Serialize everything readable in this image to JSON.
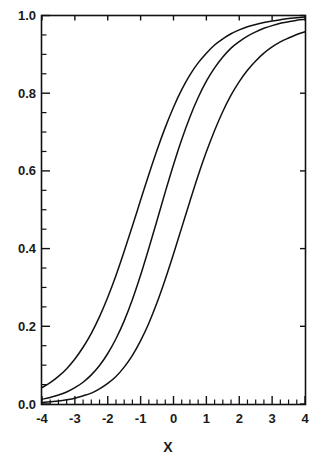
{
  "chart_data": {
    "type": "line",
    "title": "",
    "subtitle": "",
    "xlabel": "X",
    "ylabel": "",
    "xlim": [
      -4,
      4
    ],
    "ylim": [
      0.0,
      1.0
    ],
    "grid": false,
    "legend": "none",
    "x_ticks": [
      -4,
      -3,
      -2,
      -1,
      0,
      1,
      2,
      3,
      4
    ],
    "x_tick_labels": [
      "-4",
      "-3",
      "-2",
      "-1",
      "0",
      "1",
      "2",
      "3",
      "4"
    ],
    "x_minor_tick_step": 0.25,
    "y_ticks": [
      0.0,
      0.2,
      0.4,
      0.6,
      0.8,
      1.0
    ],
    "y_tick_labels": [
      "0.0",
      "0.2",
      "0.4",
      "0.6",
      "0.8",
      "1.0"
    ],
    "y_minor_tick_step": 0.05,
    "x": [
      -4,
      -3.75,
      -3.5,
      -3.25,
      -3,
      -2.75,
      -2.5,
      -2.25,
      -2,
      -1.75,
      -1.5,
      -1.25,
      -1,
      -0.75,
      -0.5,
      -0.25,
      0,
      0.25,
      0.5,
      0.75,
      1,
      1.25,
      1.5,
      1.75,
      2,
      2.25,
      2.5,
      2.75,
      3,
      3.25,
      3.5,
      3.75,
      4
    ],
    "series": [
      {
        "name": "curve-left",
        "values": [
          0.042,
          0.055,
          0.071,
          0.091,
          0.116,
          0.146,
          0.182,
          0.225,
          0.275,
          0.331,
          0.393,
          0.458,
          0.525,
          0.591,
          0.654,
          0.712,
          0.764,
          0.809,
          0.847,
          0.878,
          0.903,
          0.924,
          0.94,
          0.953,
          0.963,
          0.971,
          0.977,
          0.982,
          0.986,
          0.989,
          0.992,
          0.994,
          0.996
        ]
      },
      {
        "name": "curve-middle",
        "values": [
          0.012,
          0.017,
          0.023,
          0.031,
          0.042,
          0.056,
          0.075,
          0.099,
          0.13,
          0.168,
          0.214,
          0.269,
          0.332,
          0.401,
          0.473,
          0.546,
          0.616,
          0.681,
          0.739,
          0.789,
          0.831,
          0.865,
          0.893,
          0.916,
          0.933,
          0.947,
          0.958,
          0.967,
          0.974,
          0.98,
          0.984,
          0.988,
          0.99
        ]
      },
      {
        "name": "curve-right",
        "values": [
          0.004,
          0.006,
          0.008,
          0.011,
          0.015,
          0.021,
          0.028,
          0.039,
          0.053,
          0.071,
          0.095,
          0.125,
          0.163,
          0.208,
          0.261,
          0.321,
          0.386,
          0.454,
          0.522,
          0.588,
          0.649,
          0.704,
          0.753,
          0.795,
          0.83,
          0.859,
          0.883,
          0.903,
          0.919,
          0.932,
          0.942,
          0.951,
          0.958
        ]
      }
    ],
    "colors": {
      "curve": "#111111",
      "axis": "#111111",
      "background": "#ffffff",
      "text": "#1a1a1a"
    }
  }
}
